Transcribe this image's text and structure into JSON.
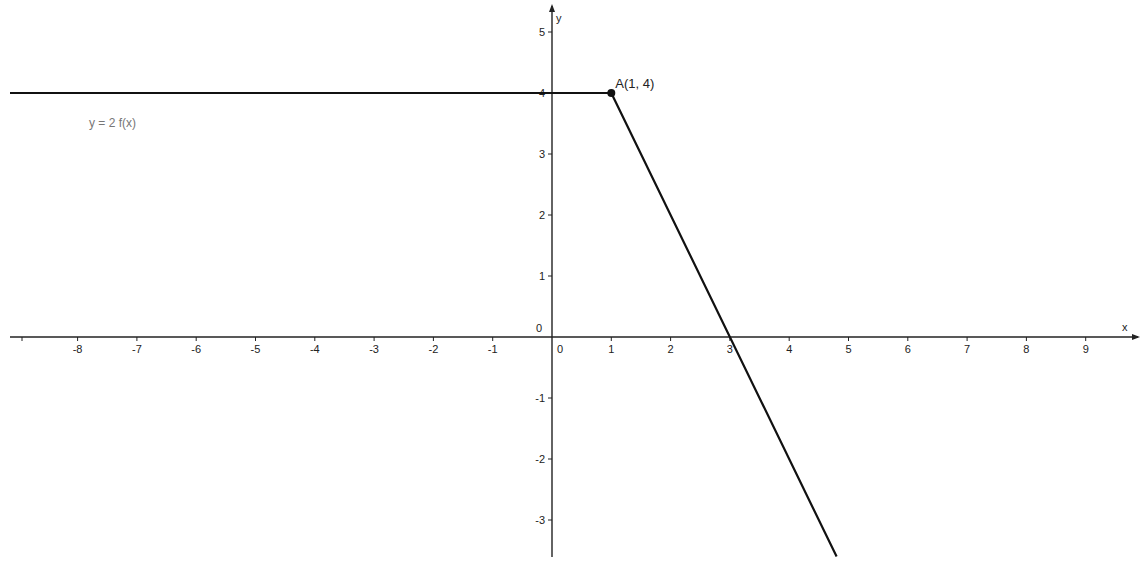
{
  "chart_data": {
    "type": "line",
    "title": "",
    "xlabel": "x",
    "ylabel": "y",
    "xlim": [
      -9.3,
      9.9
    ],
    "ylim": [
      -3.6,
      5.4
    ],
    "grid": false,
    "x_ticks": [
      -8,
      -7,
      -6,
      -5,
      -4,
      -3,
      -2,
      -1,
      0,
      1,
      2,
      3,
      4,
      5,
      6,
      7,
      8,
      9
    ],
    "y_ticks": [
      -3,
      -2,
      -1,
      0,
      1,
      2,
      3,
      4,
      5
    ],
    "series": [
      {
        "name": "y = 2 f(x)",
        "x": [
          -9.14,
          1,
          4.8
        ],
        "y": [
          4,
          4,
          -3.6
        ],
        "color": "#111111"
      }
    ],
    "points": [
      {
        "name": "A",
        "label": "A(1, 4)",
        "x": 1,
        "y": 4
      }
    ],
    "annotations": [
      {
        "text": "y = 2 f(x)",
        "x": -7.8,
        "y": 3.5
      }
    ],
    "legend": "none"
  },
  "labels": {
    "x_axis": "x",
    "y_axis": "y",
    "function": "y = 2 f(x)",
    "point": "A(1, 4)"
  },
  "colors": {
    "line": "#111111",
    "axis": "#222222",
    "background": "#ffffff"
  }
}
